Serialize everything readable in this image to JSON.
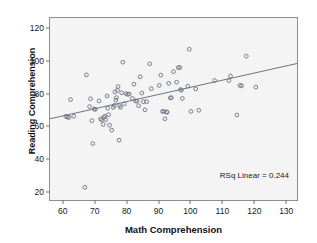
{
  "chart_data": {
    "type": "scatter",
    "title": "",
    "xlabel": "Math Comprehension",
    "ylabel": "Reading Comprehension",
    "xlim": [
      56,
      134
    ],
    "ylim": [
      14,
      126
    ],
    "xticks": [
      60,
      70,
      80,
      90,
      100,
      110,
      120,
      130
    ],
    "yticks": [
      20,
      40,
      60,
      80,
      100,
      120
    ],
    "grid": false,
    "legend": "none",
    "annotations": [
      {
        "name": "rsq-linear",
        "text": "RSq Linear = 0.244",
        "position": "bottom-right"
      }
    ],
    "fit_line": {
      "type": "linear",
      "r_squared": 0.244,
      "x_start": 56,
      "y_start": 64.0,
      "x_end": 134,
      "y_end": 98.0
    },
    "marker_style": "open-circle",
    "marker_color": "#6b7280",
    "points": [
      {
        "x": 61.0,
        "y": 65.5
      },
      {
        "x": 61.5,
        "y": 65.0
      },
      {
        "x": 62.0,
        "y": 64.8
      },
      {
        "x": 62.5,
        "y": 75.8
      },
      {
        "x": 63.5,
        "y": 65.5
      },
      {
        "x": 67.0,
        "y": 21.8
      },
      {
        "x": 67.5,
        "y": 91.0
      },
      {
        "x": 68.5,
        "y": 71.5
      },
      {
        "x": 68.8,
        "y": 76.3
      },
      {
        "x": 69.2,
        "y": 62.8
      },
      {
        "x": 69.5,
        "y": 48.7
      },
      {
        "x": 70.0,
        "y": 70.0
      },
      {
        "x": 70.3,
        "y": 69.8
      },
      {
        "x": 71.5,
        "y": 75.0
      },
      {
        "x": 72.0,
        "y": 64.0
      },
      {
        "x": 72.3,
        "y": 63.2
      },
      {
        "x": 72.8,
        "y": 60.5
      },
      {
        "x": 73.0,
        "y": 64.8
      },
      {
        "x": 73.3,
        "y": 65.5
      },
      {
        "x": 73.6,
        "y": 63.5
      },
      {
        "x": 74.0,
        "y": 78.0
      },
      {
        "x": 74.2,
        "y": 70.5
      },
      {
        "x": 74.5,
        "y": 66.5
      },
      {
        "x": 74.8,
        "y": 60.0
      },
      {
        "x": 75.5,
        "y": 57.0
      },
      {
        "x": 76.0,
        "y": 71.0
      },
      {
        "x": 76.3,
        "y": 72.2
      },
      {
        "x": 76.5,
        "y": 80.5
      },
      {
        "x": 76.8,
        "y": 75.5
      },
      {
        "x": 77.0,
        "y": 77.0
      },
      {
        "x": 77.3,
        "y": 81.5
      },
      {
        "x": 77.5,
        "y": 83.8
      },
      {
        "x": 77.8,
        "y": 50.8
      },
      {
        "x": 78.0,
        "y": 72.0
      },
      {
        "x": 78.3,
        "y": 71.0
      },
      {
        "x": 78.6,
        "y": 80.0
      },
      {
        "x": 79.0,
        "y": 98.8
      },
      {
        "x": 79.5,
        "y": 73.2
      },
      {
        "x": 80.0,
        "y": 79.5
      },
      {
        "x": 80.5,
        "y": 79.0
      },
      {
        "x": 81.0,
        "y": 79.2
      },
      {
        "x": 82.0,
        "y": 76.5
      },
      {
        "x": 82.5,
        "y": 85.3
      },
      {
        "x": 83.0,
        "y": 75.0
      },
      {
        "x": 83.5,
        "y": 74.8
      },
      {
        "x": 84.0,
        "y": 72.0
      },
      {
        "x": 84.5,
        "y": 89.8
      },
      {
        "x": 85.0,
        "y": 79.8
      },
      {
        "x": 85.5,
        "y": 74.5
      },
      {
        "x": 86.0,
        "y": 69.5
      },
      {
        "x": 86.5,
        "y": 74.5
      },
      {
        "x": 87.5,
        "y": 97.8
      },
      {
        "x": 88.0,
        "y": 82.5
      },
      {
        "x": 90.5,
        "y": 84.5
      },
      {
        "x": 91.0,
        "y": 90.8
      },
      {
        "x": 91.5,
        "y": 68.5
      },
      {
        "x": 92.0,
        "y": 68.5
      },
      {
        "x": 92.3,
        "y": 64.0
      },
      {
        "x": 92.8,
        "y": 68.2
      },
      {
        "x": 93.0,
        "y": 68.0
      },
      {
        "x": 93.5,
        "y": 85.8
      },
      {
        "x": 94.0,
        "y": 76.8
      },
      {
        "x": 94.3,
        "y": 77.0
      },
      {
        "x": 95.0,
        "y": 93.0
      },
      {
        "x": 96.0,
        "y": 86.5
      },
      {
        "x": 96.5,
        "y": 95.5
      },
      {
        "x": 97.0,
        "y": 95.5
      },
      {
        "x": 97.2,
        "y": 82.0
      },
      {
        "x": 97.5,
        "y": 81.5
      },
      {
        "x": 97.8,
        "y": 76.5
      },
      {
        "x": 99.5,
        "y": 84.0
      },
      {
        "x": 100.0,
        "y": 106.8
      },
      {
        "x": 100.5,
        "y": 68.5
      },
      {
        "x": 102.0,
        "y": 82.3
      },
      {
        "x": 103.0,
        "y": 69.2
      },
      {
        "x": 108.0,
        "y": 87.5
      },
      {
        "x": 112.5,
        "y": 87.5
      },
      {
        "x": 113.0,
        "y": 90.3
      },
      {
        "x": 115.0,
        "y": 66.3
      },
      {
        "x": 116.0,
        "y": 84.5
      },
      {
        "x": 116.5,
        "y": 84.3
      },
      {
        "x": 118.0,
        "y": 102.5
      },
      {
        "x": 121.0,
        "y": 83.5
      }
    ]
  }
}
